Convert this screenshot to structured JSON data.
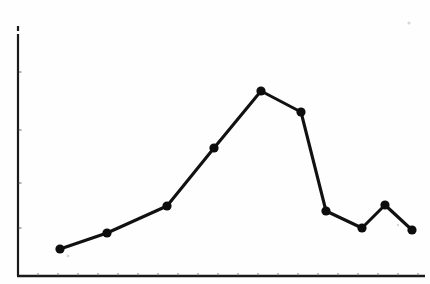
{
  "document": {
    "kind": "scanned-line-chart",
    "title": "",
    "background_color": "#fefefe",
    "ink_color": "#111111"
  },
  "chart_data": {
    "type": "line",
    "title": "",
    "subtitle": "",
    "xlabel": "",
    "ylabel": "",
    "legend": [],
    "legend_position": "none",
    "grid": false,
    "axis_tick_labels_visible": false,
    "marker": "filled-circle",
    "marker_color": "#0d0d0d",
    "line_color": "#111111",
    "x": [
      1,
      2,
      3,
      4,
      5,
      6,
      7,
      8,
      9,
      10
    ],
    "categories": [
      "1",
      "2",
      "3",
      "4",
      "5",
      "6",
      "7",
      "8",
      "9",
      "10"
    ],
    "values": [
      14,
      21,
      33,
      58,
      82,
      72,
      29,
      22,
      32,
      21
    ],
    "series": [
      {
        "name": "series-1",
        "values": [
          14,
          21,
          33,
          58,
          82,
          72,
          29,
          22,
          32,
          21
        ]
      }
    ],
    "xlim": [
      0.4,
      11.2
    ],
    "ylim": [
      0,
      100
    ],
    "pixel_points": [
      {
        "x": 60,
        "y": 249
      },
      {
        "x": 107,
        "y": 233
      },
      {
        "x": 167,
        "y": 206
      },
      {
        "x": 214,
        "y": 148
      },
      {
        "x": 261,
        "y": 91
      },
      {
        "x": 301,
        "y": 112
      },
      {
        "x": 326,
        "y": 211
      },
      {
        "x": 362,
        "y": 228
      },
      {
        "x": 385,
        "y": 205
      },
      {
        "x": 412,
        "y": 230
      }
    ],
    "peak": {
      "index": 4,
      "value": 82
    },
    "minimum": {
      "index": 0,
      "value": 14
    }
  },
  "axes": {
    "y_axis": {
      "x": 18,
      "y_top": 26,
      "y_bottom": 276,
      "break_gap": {
        "from": 31,
        "to": 34
      },
      "ticks": [
        72,
        130,
        183,
        228
      ]
    },
    "x_axis": {
      "y": 276,
      "x_left": 18,
      "x_right": 425,
      "tick_count": 20,
      "tick_spacing": 20
    }
  },
  "artifacts": [
    {
      "name": "scan-speck-top-right",
      "x": 409,
      "y": 23,
      "r": 1.6
    },
    {
      "name": "scan-speck-first-point",
      "x": 68,
      "y": 256,
      "r": 1.4
    },
    {
      "name": "scan-speck-last-point",
      "x": 398,
      "y": 225,
      "r": 1.2
    }
  ]
}
